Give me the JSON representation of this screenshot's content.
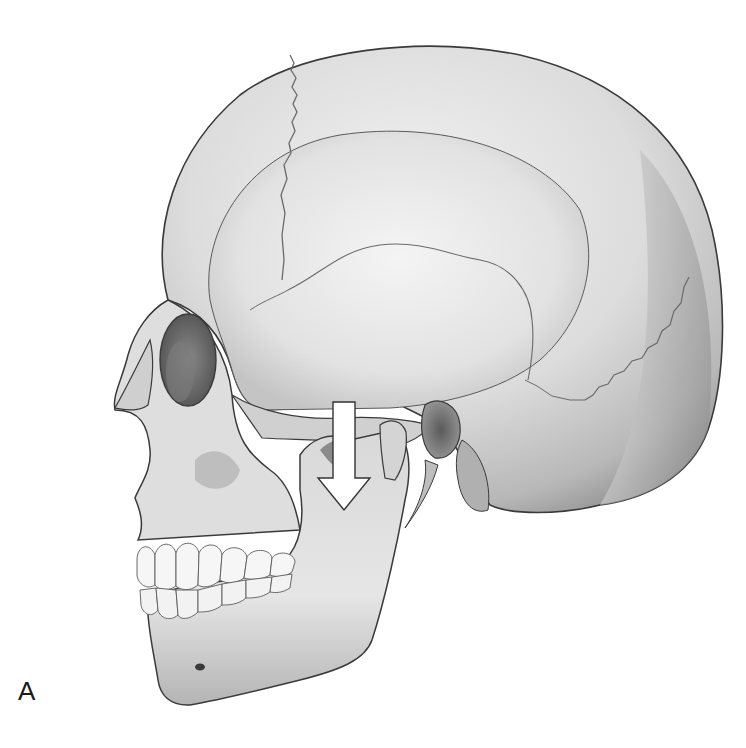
{
  "figure": {
    "panel_label": "A",
    "annotation": {
      "type": "arrow",
      "direction": "down",
      "meaning": "downward displacement of mandible / condyle",
      "fill": "#ffffff",
      "stroke": "#333333"
    },
    "palette": {
      "background": "#ffffff",
      "bone_light": "#ececec",
      "bone_mid": "#c8c8c8",
      "bone_dark": "#8a8a8a",
      "outline": "#3a3a3a",
      "cavity": "#6e6e6e",
      "teeth": "#f6f6f6"
    }
  }
}
